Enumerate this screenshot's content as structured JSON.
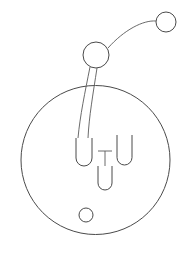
{
  "figure": {
    "title": "Line drawing of an enclosing circle with flask shapes and connected nodes",
    "background_color": "#ffffff",
    "stroke_color": "#4a4a4a",
    "stroke_width": 1,
    "canvas": {
      "width": 191,
      "height": 259
    }
  },
  "shapes": {
    "enclosure_circle": {
      "label": "large enclosing circle",
      "cx": 95.5,
      "cy": 160,
      "r": 74.5
    },
    "node_circle_main": {
      "label": "upper node circle",
      "cx": 96,
      "cy": 55,
      "r": 13
    },
    "node_circle_small": {
      "label": "top right node circle",
      "cx": 166,
      "cy": 22,
      "r": 10
    },
    "bottom_circle": {
      "label": "small circle inside enclosure",
      "cx": 86,
      "cy": 215,
      "r": 7
    },
    "flask_left": {
      "label": "left rounded tube",
      "x": 76,
      "y": 138,
      "width": 16,
      "height": 28,
      "radius": 8
    },
    "flask_right": {
      "label": "right rounded tube",
      "x": 117,
      "y": 135,
      "width": 15,
      "height": 30,
      "radius": 7.5
    },
    "flask_middle": {
      "label": "middle rounded tube with stem",
      "x": 98,
      "y": 166,
      "width": 14,
      "height": 24,
      "radius": 7
    },
    "stem_vertical": {
      "label": "vertical stem above middle tube",
      "x": 105,
      "y1": 151,
      "y2": 166
    },
    "stem_crossbar": {
      "label": "horizontal crossbar on stem",
      "y": 151,
      "x1": 98,
      "x2": 112
    }
  },
  "connectors": {
    "arc_to_small_node": {
      "label": "arc from main node to top right node",
      "path": "M 108 48 C 124 30 143 20 156 21"
    },
    "tube_line_left": {
      "label": "left curved line from node to tube",
      "path": "M 90 67 C 85 92 80 116 78 138"
    },
    "tube_line_right": {
      "label": "right curved line from node to tube",
      "path": "M 97 68 C 93 94 89 117 88 138"
    }
  }
}
